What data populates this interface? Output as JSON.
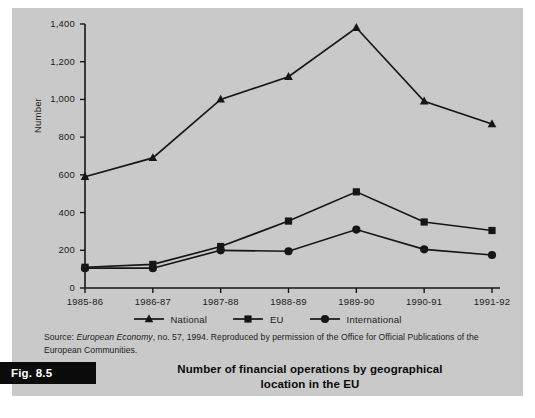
{
  "figure": {
    "tag": "Fig. 8.5",
    "title_line1": "Number of financial operations by geographical",
    "title_line2": "location in the EU",
    "source_prefix": "Source: ",
    "source_italic": "European Economy",
    "source_rest": ", no. 57, 1994. Reproduced by permission of the Office for Official Publications of the European Communities."
  },
  "colors": {
    "panel_background": "#c9c9c9",
    "page_background": "#ffffff",
    "ink": "#1c1c1c",
    "series_line": "#161616",
    "tag_background": "#0b0b0b",
    "tag_text": "#ffffff"
  },
  "chart_data": {
    "type": "line",
    "title": "Number of financial operations by geographical location in the EU",
    "xlabel": "",
    "ylabel": "Number",
    "categories": [
      "1985-86",
      "1986-87",
      "1987-88",
      "1988-89",
      "1989-90",
      "1990-91",
      "1991-92"
    ],
    "ylim": [
      0,
      1400
    ],
    "yticks": [
      0,
      200,
      400,
      600,
      800,
      1000,
      1200,
      1400
    ],
    "ytick_labels": [
      "0",
      "200",
      "400",
      "600",
      "800",
      "1,000",
      "1,200",
      "1,400"
    ],
    "grid": false,
    "legend_position": "below-axis",
    "series": [
      {
        "name": "National",
        "marker": "triangle",
        "values": [
          590,
          690,
          1000,
          1120,
          1380,
          990,
          870
        ]
      },
      {
        "name": "EU",
        "marker": "square",
        "values": [
          110,
          125,
          220,
          355,
          510,
          350,
          305
        ]
      },
      {
        "name": "International",
        "marker": "circle",
        "values": [
          105,
          105,
          200,
          195,
          310,
          205,
          175
        ]
      }
    ]
  }
}
